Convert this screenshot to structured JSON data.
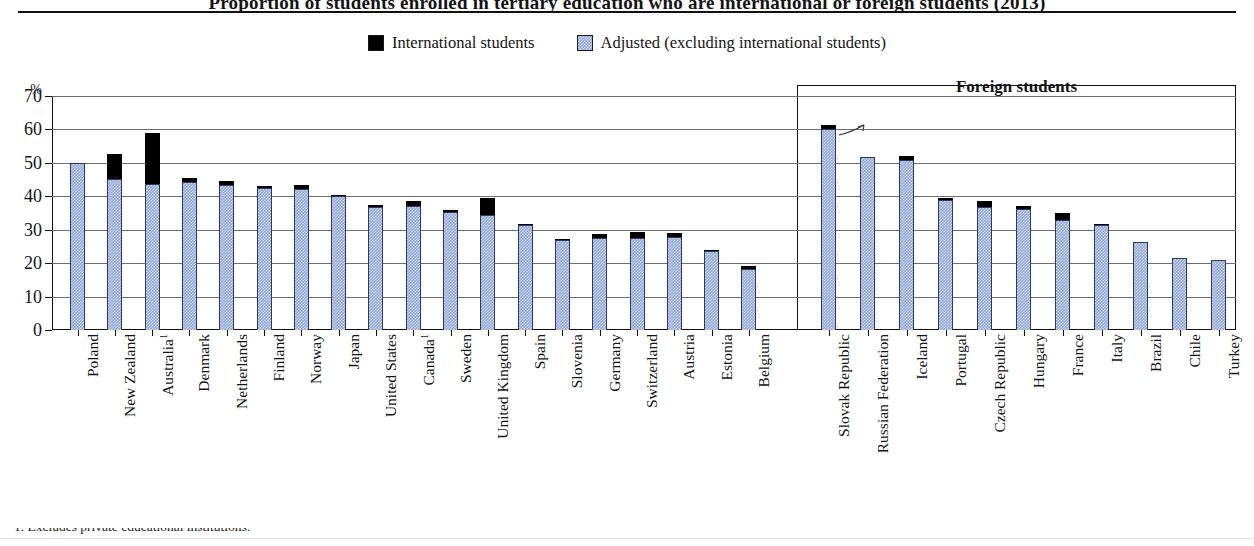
{
  "title": "Proportion of students enrolled in tertiary education who are international or foreign students (2013)",
  "footnote": "1. Excludes private educational institutions.",
  "legend": [
    {
      "label": "International students",
      "color": "#000000",
      "icon": "black-square-swatch"
    },
    {
      "label": "Adjusted (excluding international students)",
      "color": "#93aad9",
      "icon": "blue-square-swatch"
    }
  ],
  "axis": {
    "unit": "%",
    "ticks": [
      "0",
      "10",
      "20",
      "30",
      "40",
      "50",
      "60",
      "70"
    ]
  },
  "panels": {
    "right_label": "Foreign students"
  },
  "chart_data": {
    "type": "bar",
    "title": "Proportion of students enrolled in tertiary education who are international or foreign students (2013)",
    "subtype": "stacked",
    "xlabel": "",
    "ylabel": "%",
    "ylim": [
      0,
      70
    ],
    "ytick_step": 10,
    "grid": true,
    "legend_position": "top-center",
    "series": [
      {
        "name": "Adjusted (excluding international students)",
        "color": "#93aad9"
      },
      {
        "name": "International students",
        "color": "#000000"
      }
    ],
    "panels": [
      {
        "name": "International students",
        "categories": [
          "Poland",
          "New Zealand",
          "Australia¹",
          "Denmark",
          "Netherlands",
          "Finland",
          "Norway",
          "Japan",
          "United States",
          "Canada¹",
          "Sweden",
          "United Kingdom",
          "Spain",
          "Slovenia",
          "Germany",
          "Switzerland",
          "Austria",
          "Estonia",
          "Belgium"
        ],
        "adjusted": [
          50.0,
          45.2,
          43.8,
          44.4,
          43.3,
          42.4,
          42.3,
          40.2,
          36.9,
          37.2,
          35.4,
          34.5,
          31.4,
          27.0,
          27.6,
          27.4,
          27.7,
          23.5,
          18.2
        ],
        "international": [
          0.0,
          7.6,
          15.2,
          1.1,
          1.2,
          0.6,
          1.2,
          0.1,
          0.5,
          1.4,
          0.6,
          5.0,
          0.4,
          0.2,
          1.0,
          2.0,
          1.3,
          0.4,
          1.0
        ],
        "total": [
          50.0,
          52.8,
          59.0,
          45.5,
          44.5,
          43.0,
          43.5,
          40.3,
          37.4,
          38.6,
          36.0,
          39.5,
          31.8,
          27.2,
          28.6,
          29.4,
          29.0,
          23.9,
          19.2
        ]
      },
      {
        "name": "Foreign students",
        "categories": [
          "Slovak Republic",
          "Russian Federation",
          "Iceland",
          "Portugal",
          "Czech Republic",
          "Hungary",
          "France",
          "Italy",
          "Brazil",
          "Chile",
          "Turkey"
        ],
        "adjusted": [
          60.0,
          51.8,
          51.0,
          38.9,
          36.9,
          36.2,
          32.8,
          31.3,
          26.3,
          21.4,
          21.0
        ],
        "international": [
          1.2,
          0.0,
          1.0,
          0.6,
          1.6,
          0.9,
          2.3,
          0.2,
          0.0,
          0.0,
          0.0
        ],
        "total": [
          61.2,
          51.8,
          52.0,
          39.5,
          38.5,
          37.1,
          35.1,
          31.5,
          26.3,
          21.4,
          21.0
        ]
      }
    ]
  }
}
